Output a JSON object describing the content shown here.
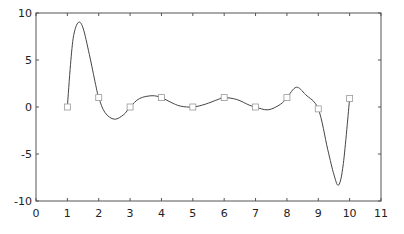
{
  "chart_data": {
    "type": "line",
    "title": "",
    "xlabel": "",
    "ylabel": "",
    "xlim": [
      0,
      11
    ],
    "ylim": [
      -10,
      10
    ],
    "grid": false,
    "legend": null,
    "x_ticks": [
      "0",
      "1",
      "2",
      "3",
      "4",
      "5",
      "6",
      "7",
      "8",
      "9",
      "10",
      "11"
    ],
    "y_ticks": [
      "-10",
      "-5",
      "0",
      "5",
      "10"
    ],
    "series": [
      {
        "name": "data points",
        "style": "square markers",
        "x": [
          1,
          2,
          3,
          4,
          5,
          6,
          7,
          8,
          9,
          10
        ],
        "values": [
          0,
          1,
          0,
          1,
          0,
          1,
          0,
          1,
          -0.2,
          0.9
        ]
      },
      {
        "name": "interpolated curve",
        "style": "solid line",
        "x": [
          1.0,
          1.1,
          1.2,
          1.35,
          1.5,
          1.7,
          1.9,
          2.0,
          2.2,
          2.5,
          2.8,
          3.0,
          3.3,
          3.7,
          4.0,
          4.3,
          4.6,
          5.0,
          5.4,
          5.8,
          6.0,
          6.4,
          6.8,
          7.0,
          7.4,
          7.8,
          8.0,
          8.3,
          8.6,
          9.0,
          9.3,
          9.5,
          9.65,
          9.8,
          10.0
        ],
        "values": [
          0,
          4.5,
          7.6,
          9.0,
          8.4,
          5.6,
          2.4,
          1.0,
          -0.6,
          -1.3,
          -0.8,
          0.0,
          0.9,
          1.2,
          1.0,
          0.5,
          0.1,
          0.0,
          0.3,
          0.8,
          1.0,
          0.8,
          0.2,
          0.0,
          -0.3,
          0.3,
          1.0,
          2.1,
          1.3,
          -0.2,
          -4.5,
          -7.2,
          -8.3,
          -6.0,
          0.9
        ]
      }
    ]
  }
}
